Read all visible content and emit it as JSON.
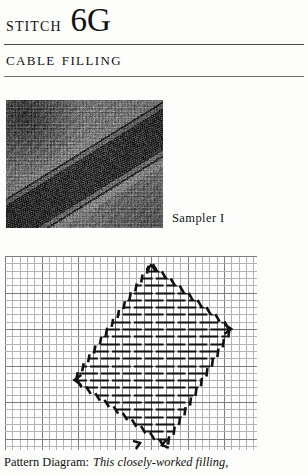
{
  "header": {
    "stitch_label": "Stitch",
    "stitch_code": "6G",
    "subtitle": "Cable Filling"
  },
  "photo": {
    "alt_name": "needlework-sampler-photograph",
    "caption": "Sampler I"
  },
  "diagram": {
    "alt_name": "cable-filling-pattern-diagram",
    "grid": {
      "cell_px": 7.3,
      "major_every": 5,
      "minor_color": "#b4b4b4",
      "major_color": "#7d7d7d",
      "background": "#ffffff",
      "cols": 34,
      "rows": 26
    },
    "stitch_color": "#111111",
    "outline_style": "dashed-diagonal-stitches",
    "fill_style": "horizontal-cable-bars-staggered"
  },
  "caption": {
    "lead": "Pattern Diagram:",
    "body": "This closely-worked filling,"
  },
  "colors": {
    "page_background": "#fdfdfb",
    "rule": "#4a4a4a",
    "text": "#111111"
  }
}
